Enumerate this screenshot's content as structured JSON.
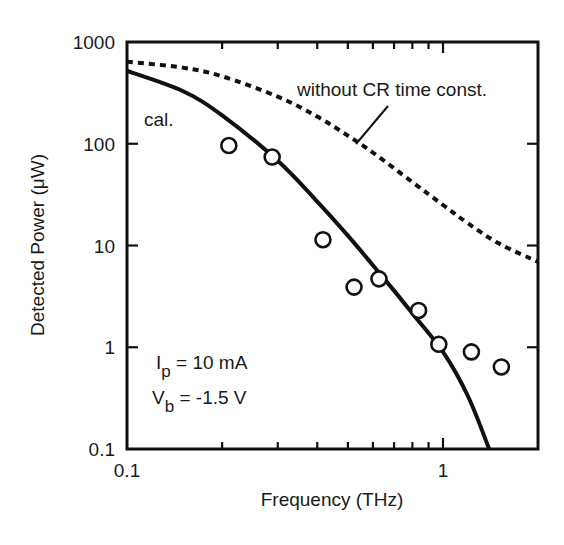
{
  "chart_data": {
    "type": "line",
    "title": "",
    "xlabel": "Frequency (THz)",
    "ylabel": "Detected Power (μW)",
    "xscale": "log",
    "yscale": "log",
    "xlim": [
      0.1,
      2.0
    ],
    "ylim": [
      0.1,
      1000
    ],
    "grid": false,
    "legend": null,
    "x_ticks": [
      {
        "value": 0.1,
        "label": "0.1"
      },
      {
        "value": 1,
        "label": "1"
      }
    ],
    "y_ticks": [
      {
        "value": 0.1,
        "label": "0.1"
      },
      {
        "value": 1,
        "label": "1"
      },
      {
        "value": 10,
        "label": "10"
      },
      {
        "value": 100,
        "label": "100"
      },
      {
        "value": 1000,
        "label": "1000"
      }
    ],
    "series": [
      {
        "name": "measured",
        "style": "open-circle markers",
        "x": [
          0.21,
          0.288,
          0.417,
          0.523,
          0.627,
          0.837,
          0.97,
          1.23,
          1.53
        ],
        "values": [
          96,
          74,
          11.4,
          3.9,
          4.7,
          2.3,
          1.07,
          0.9,
          0.64
        ]
      },
      {
        "name": "cal.",
        "style": "solid line",
        "x": [
          0.1,
          0.15,
          0.2,
          0.3,
          0.4,
          0.5,
          0.6,
          0.7,
          0.8,
          1.0,
          1.2,
          1.4
        ],
        "values": [
          520,
          330,
          190,
          68,
          27,
          12.5,
          6.4,
          3.6,
          2.15,
          0.9,
          0.33,
          0.1
        ]
      },
      {
        "name": "without CR time const.",
        "style": "dashed line",
        "x": [
          0.1,
          0.15,
          0.2,
          0.3,
          0.4,
          0.5,
          0.6,
          0.8,
          1.0,
          1.2,
          1.5,
          2.0
        ],
        "values": [
          640,
          560,
          460,
          290,
          185,
          120,
          82,
          42,
          25,
          16.5,
          10.5,
          6.9
        ]
      }
    ],
    "annotations": [
      {
        "text": "cal.",
        "x": 0.105,
        "y": 230
      },
      {
        "text": "without CR time const.",
        "x": 0.3,
        "y": 370,
        "leader_line": true
      },
      {
        "text": "I_p = 10 mA",
        "x": 0.105,
        "y": 0.8
      },
      {
        "text": "V_b = -1.5 V",
        "x": 0.105,
        "y": 0.3
      }
    ]
  },
  "labels": {
    "xlabel": "Frequency (THz)",
    "ylabel": "Detected Power (μW)",
    "cal": "cal.",
    "dashed_label": "without CR time const.",
    "ip_main": "I",
    "ip_sub": "p",
    "ip_rest": " = 10 mA",
    "vb_main": "V",
    "vb_sub": "b",
    "vb_rest": " = -1.5 V"
  },
  "colors": {
    "ink": "#111111",
    "background": "#ffffff"
  }
}
